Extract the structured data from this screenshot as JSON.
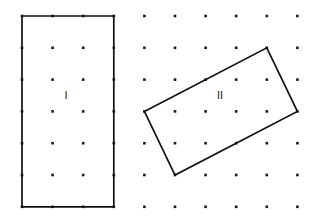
{
  "figure": {
    "type": "dot-grid-geometry-figure",
    "width": 315,
    "height": 224,
    "background_color": "#ffffff"
  },
  "grid": {
    "name": "dot-lattice",
    "dot_color": "#1a1a1a",
    "dot_size": 2.6,
    "columns": 10,
    "rows": 7,
    "x_start": 22,
    "y_start": 16,
    "x_spacing": 30.6,
    "y_spacing": 31.8,
    "x_positions": [
      22,
      52.6,
      83.2,
      113.8,
      144.4,
      175,
      205.6,
      236.2,
      266.8,
      297.4
    ],
    "y_positions": [
      16,
      47.8,
      79.6,
      111.4,
      143.2,
      175,
      206.8
    ]
  },
  "shapes": [
    {
      "id": "rectangle-one",
      "label": "I",
      "label_x": 66,
      "label_y": 96,
      "stroke_color": "#111111",
      "stroke_width": 1.7,
      "orientation": "axis-aligned",
      "points": "22,16 113.8,16 113.8,206.8 22,206.8",
      "vertices": [
        {
          "x": 22,
          "y": 16
        },
        {
          "x": 113.8,
          "y": 16
        },
        {
          "x": 113.8,
          "y": 206.8
        },
        {
          "x": 22,
          "y": 206.8
        }
      ],
      "width_units": 3,
      "height_units": 6
    },
    {
      "id": "rectangle-two",
      "label": "II",
      "label_x": 220,
      "label_y": 96,
      "stroke_color": "#111111",
      "stroke_width": 1.7,
      "orientation": "rotated",
      "points": "144.4,111.4 266.8,47.8 297.4,111.4 175,175",
      "vertices": [
        {
          "x": 144.4,
          "y": 111.4
        },
        {
          "x": 266.8,
          "y": 47.8
        },
        {
          "x": 297.4,
          "y": 111.4
        },
        {
          "x": 175,
          "y": 175
        }
      ],
      "width_units": 3,
      "height_units": 6
    }
  ]
}
